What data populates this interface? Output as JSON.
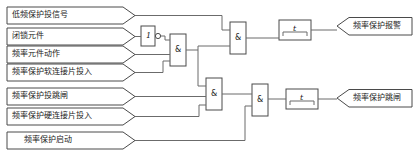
{
  "diagram": {
    "type": "logic-diagram",
    "size": {
      "width": 419,
      "height": 163
    },
    "colors": {
      "background": "#ffffff",
      "wire": "#6b6b6b",
      "shape_stroke": "#4a4a4a",
      "text": "#1a1a1a"
    },
    "inputs": [
      {
        "id": "in1",
        "label": "低频保护投信号"
      },
      {
        "id": "in2",
        "label": "闭锁元件"
      },
      {
        "id": "in3",
        "label": "频率元件动作"
      },
      {
        "id": "in4",
        "label": "频率保护软连接片投入"
      },
      {
        "id": "in5",
        "label": "频率保护投跳闸"
      },
      {
        "id": "in6",
        "label": "频率保护硬连接片投入"
      },
      {
        "id": "in7",
        "label": "频率保护启动"
      }
    ],
    "gates": [
      {
        "id": "not1",
        "symbol": "1",
        "kind": "not-gate",
        "inverted": true
      },
      {
        "id": "and1",
        "symbol": "&",
        "kind": "and-gate"
      },
      {
        "id": "and2",
        "symbol": "&",
        "kind": "and-gate"
      },
      {
        "id": "and3",
        "symbol": "&",
        "kind": "and-gate"
      },
      {
        "id": "and4",
        "symbol": "&",
        "kind": "and-gate"
      },
      {
        "id": "timer1",
        "symbol": "t",
        "kind": "timer-block"
      },
      {
        "id": "timer2",
        "symbol": "t",
        "kind": "timer-block"
      }
    ],
    "outputs": [
      {
        "id": "out1",
        "label": "频率保护报警"
      },
      {
        "id": "out2",
        "label": "频率保护跳闸"
      }
    ]
  }
}
